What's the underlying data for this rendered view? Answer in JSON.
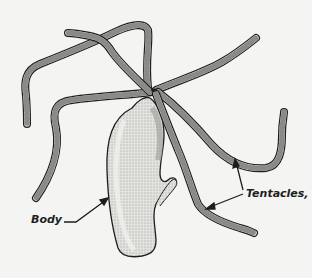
{
  "figure": {
    "labels": {
      "body": "Body",
      "tentacles": "Tentacles,"
    }
  },
  "colors": {
    "background": "#f4f4f2",
    "ink": "#1e1e1e",
    "tentacle_fill": "#e6e6e2",
    "body_fill": "#dcdcd8"
  }
}
